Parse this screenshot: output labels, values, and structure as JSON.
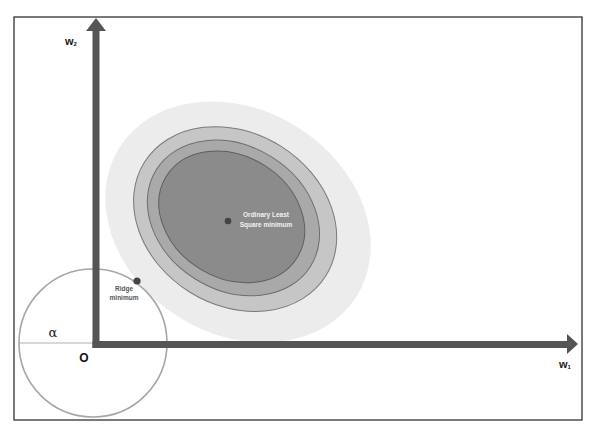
{
  "diagram": {
    "title": "",
    "axes": {
      "x_label": "w",
      "x_label_subscript": "1",
      "y_label": "w",
      "y_label_subscript": "2",
      "origin_label": "O"
    },
    "constraint_region": {
      "shape": "circle",
      "radius_label": "α"
    },
    "points": {
      "ols": {
        "label_line1": "Ordinary Least",
        "label_line2": "Square minimum"
      },
      "ridge": {
        "label_line1": "Ridge",
        "label_line2": "minimum"
      }
    },
    "contours": [
      {
        "name": "contour-1-outer",
        "color": "#ededed"
      },
      {
        "name": "contour-2",
        "color": "#c4c4c4"
      },
      {
        "name": "contour-3",
        "color": "#a9a9a9"
      },
      {
        "name": "contour-4-inner",
        "color": "#8a8a8a"
      }
    ],
    "colors": {
      "axis": "#555555",
      "frame": "#333333",
      "circle": "#a6a6a6",
      "point": "#444444",
      "contour_outline": "#6b6b6b",
      "ols_label": "#f2f2f2",
      "ridge_label": "#555555"
    }
  }
}
